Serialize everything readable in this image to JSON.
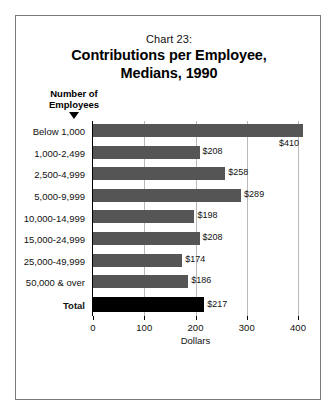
{
  "chart_data": {
    "type": "bar",
    "orientation": "horizontal",
    "title": "Contributions per Employee,\nMedians, 1990",
    "title_line1": "Contributions per Employee,",
    "title_line2": "Medians, 1990",
    "chart_number": "Chart 23:",
    "category_axis_caption_line1": "Number of",
    "category_axis_caption_line2": "Employees",
    "xlabel": "Dollars",
    "ylabel": "Number of Employees",
    "xlim": [
      0,
      400
    ],
    "xticks": [
      0,
      100,
      200,
      300,
      400
    ],
    "xtick_labels": [
      "0",
      "100",
      "200",
      "300",
      "400"
    ],
    "grid": true,
    "grid_axis": "x",
    "legend": false,
    "categories": [
      "Below 1,000",
      "1,000-2,499",
      "2,500-4,999",
      "5,000-9,999",
      "10,000-14,999",
      "15,000-24,999",
      "25,000-49,999",
      "50,000 & over",
      "Total"
    ],
    "values": [
      410,
      208,
      258,
      289,
      198,
      208,
      174,
      186,
      217
    ],
    "value_labels": [
      "$410",
      "$208",
      "$258",
      "$289",
      "$198",
      "$208",
      "$174",
      "$186",
      "$217"
    ],
    "bars": [
      {
        "category": "Below 1,000",
        "value": 410,
        "label": "$410",
        "total": false
      },
      {
        "category": "1,000-2,499",
        "value": 208,
        "label": "$208",
        "total": false
      },
      {
        "category": "2,500-4,999",
        "value": 258,
        "label": "$258",
        "total": false
      },
      {
        "category": "5,000-9,999",
        "value": 289,
        "label": "$289",
        "total": false
      },
      {
        "category": "10,000-14,999",
        "value": 198,
        "label": "$198",
        "total": false
      },
      {
        "category": "15,000-24,999",
        "value": 208,
        "label": "$208",
        "total": false
      },
      {
        "category": "25,000-49,999",
        "value": 174,
        "label": "$174",
        "total": false
      },
      {
        "category": "50,000 & over",
        "value": 186,
        "label": "$186",
        "total": false
      },
      {
        "category": "Total",
        "value": 217,
        "label": "$217",
        "total": true
      }
    ],
    "colors": {
      "bar": "#555555",
      "total_bar": "#000000",
      "grid": "#b9b9b9",
      "axis": "#000000",
      "frame": "#7a7a7a",
      "background": "#ffffff",
      "text": "#111111"
    }
  }
}
